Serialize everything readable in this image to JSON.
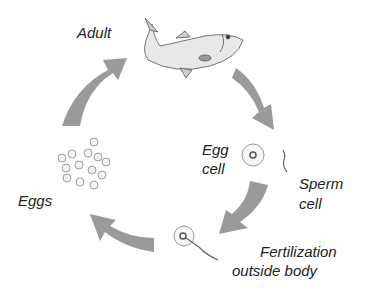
{
  "diagram": {
    "stages": {
      "adult": "Adult",
      "egg_cell_line1": "Egg",
      "egg_cell_line2": "cell",
      "sperm_line1": "Sperm",
      "sperm_line2": "cell",
      "fert_line1": "Fertilization",
      "fert_line2": "outside body",
      "eggs": "Eggs"
    },
    "colors": {
      "arrow": "#9a9a9a",
      "text": "#222222"
    }
  }
}
